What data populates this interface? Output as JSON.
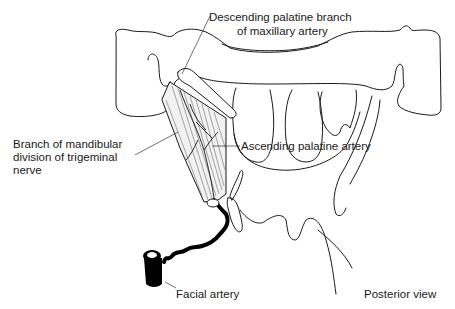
{
  "figure": {
    "view_label": "Posterior view",
    "labels": [
      {
        "id": "descending-palatine",
        "lines": [
          "Descending palatine branch",
          "of maxillary artery"
        ]
      },
      {
        "id": "mandibular-branch",
        "lines": [
          "Branch of mandibular",
          "division of trigeminal",
          "nerve"
        ]
      },
      {
        "id": "ascending-palatine",
        "lines": [
          "Ascending palatine artery"
        ]
      },
      {
        "id": "facial-artery",
        "lines": [
          "Facial artery"
        ]
      }
    ]
  },
  "colors": {
    "ink": "#1a1a1a",
    "background": "#ffffff"
  }
}
